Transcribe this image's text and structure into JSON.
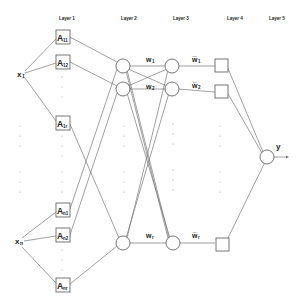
{
  "layers": [
    {
      "label": "Layer 1",
      "x": 66
    },
    {
      "label": "Layer 2",
      "x": 128
    },
    {
      "label": "Layer 3",
      "x": 180
    },
    {
      "label": "Layer 4",
      "x": 233
    },
    {
      "label": "Layer 5",
      "x": 275
    }
  ],
  "inputs": [
    {
      "label": "x",
      "sub": "1",
      "x": 20,
      "y": 76
    },
    {
      "label": "x",
      "sub": "n",
      "x": 18,
      "y": 243
    }
  ],
  "layer1_nodes": [
    {
      "label": "A",
      "sub": "11",
      "y": 37
    },
    {
      "label": "A",
      "sub": "12",
      "y": 62
    },
    {
      "label": "A",
      "sub": "1r",
      "y": 123
    },
    {
      "label": "A",
      "sub": "n1",
      "y": 210
    },
    {
      "label": "A",
      "sub": "n2",
      "y": 235
    },
    {
      "label": "A",
      "sub": "nr",
      "y": 285
    }
  ],
  "layer2_nodes": [
    {
      "y": 66
    },
    {
      "y": 89
    },
    {
      "y": 243
    }
  ],
  "layer3_nodes": [
    {
      "y": 66
    },
    {
      "y": 89
    },
    {
      "y": 243
    }
  ],
  "layer4_nodes": [
    {
      "y": 66
    },
    {
      "y": 92
    },
    {
      "y": 243
    }
  ],
  "weights_23": [
    {
      "label": "w",
      "sub": "1"
    },
    {
      "label": "w",
      "sub": "2"
    },
    {
      "label": "w",
      "sub": "r"
    }
  ],
  "weights_34": [
    {
      "label": "w̅",
      "sub": "1"
    },
    {
      "label": "w̅",
      "sub": "2"
    },
    {
      "label": "w̅",
      "sub": "r"
    }
  ],
  "output": {
    "label": "y",
    "x": 267,
    "y": 157
  },
  "colors": {
    "stroke": "#777777",
    "text": "#222222",
    "background": "#ffffff"
  }
}
